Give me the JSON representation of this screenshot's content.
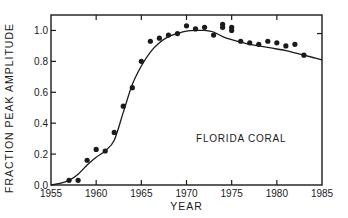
{
  "chart_data": {
    "type": "scatter",
    "title": "",
    "xlabel": "YEAR",
    "ylabel": "FRACTION PEAK AMPLITUDE",
    "xlim": [
      1955,
      1985
    ],
    "ylim": [
      0.0,
      1.1
    ],
    "x_ticks": [
      1955,
      1960,
      1965,
      1970,
      1975,
      1980,
      1985
    ],
    "x_tick_labels": [
      "1955",
      "1960",
      "1965",
      "1970",
      "1975",
      "1980",
      "1985"
    ],
    "y_ticks": [
      0.0,
      0.2,
      0.4,
      0.6,
      0.8,
      1.0
    ],
    "y_tick_labels": [
      "0.0",
      "0.2",
      "0.4",
      "0.6",
      "0.8",
      "1.0"
    ],
    "grid": false,
    "legend": null,
    "annotations": [
      {
        "text": "FLORIDA CORAL",
        "x": 1972,
        "y": 0.2
      }
    ],
    "series": [
      {
        "name": "Measured coral data",
        "style": "points",
        "points": [
          {
            "x": 1957,
            "y": 0.03
          },
          {
            "x": 1958,
            "y": 0.03
          },
          {
            "x": 1959,
            "y": 0.16
          },
          {
            "x": 1960,
            "y": 0.23
          },
          {
            "x": 1961,
            "y": 0.22
          },
          {
            "x": 1962,
            "y": 0.34
          },
          {
            "x": 1963,
            "y": 0.51
          },
          {
            "x": 1964,
            "y": 0.63
          },
          {
            "x": 1965,
            "y": 0.8
          },
          {
            "x": 1966,
            "y": 0.93
          },
          {
            "x": 1967,
            "y": 0.95
          },
          {
            "x": 1968,
            "y": 0.97
          },
          {
            "x": 1969,
            "y": 0.98
          },
          {
            "x": 1970,
            "y": 1.03
          },
          {
            "x": 1971,
            "y": 1.01
          },
          {
            "x": 1972,
            "y": 1.02
          },
          {
            "x": 1973,
            "y": 0.97
          },
          {
            "x": 1974,
            "y": 1.04
          },
          {
            "x": 1974,
            "y": 1.02
          },
          {
            "x": 1975,
            "y": 1.02
          },
          {
            "x": 1975,
            "y": 1.0
          },
          {
            "x": 1976,
            "y": 0.93
          },
          {
            "x": 1977,
            "y": 0.92
          },
          {
            "x": 1978,
            "y": 0.91
          },
          {
            "x": 1979,
            "y": 0.93
          },
          {
            "x": 1980,
            "y": 0.92
          },
          {
            "x": 1981,
            "y": 0.9
          },
          {
            "x": 1982,
            "y": 0.91
          },
          {
            "x": 1983,
            "y": 0.84
          }
        ]
      },
      {
        "name": "Model curve",
        "style": "line",
        "points": [
          {
            "x": 1955,
            "y": 0.0
          },
          {
            "x": 1956,
            "y": 0.01
          },
          {
            "x": 1957,
            "y": 0.03
          },
          {
            "x": 1958,
            "y": 0.07
          },
          {
            "x": 1959,
            "y": 0.13
          },
          {
            "x": 1960,
            "y": 0.18
          },
          {
            "x": 1961,
            "y": 0.22
          },
          {
            "x": 1962,
            "y": 0.29
          },
          {
            "x": 1963,
            "y": 0.47
          },
          {
            "x": 1964,
            "y": 0.65
          },
          {
            "x": 1965,
            "y": 0.77
          },
          {
            "x": 1966,
            "y": 0.86
          },
          {
            "x": 1967,
            "y": 0.92
          },
          {
            "x": 1968,
            "y": 0.96
          },
          {
            "x": 1969,
            "y": 0.98
          },
          {
            "x": 1970,
            "y": 0.995
          },
          {
            "x": 1971,
            "y": 1.0
          },
          {
            "x": 1972,
            "y": 1.0
          },
          {
            "x": 1973,
            "y": 0.99
          },
          {
            "x": 1974,
            "y": 0.96
          },
          {
            "x": 1975,
            "y": 0.94
          },
          {
            "x": 1976,
            "y": 0.925
          },
          {
            "x": 1977,
            "y": 0.91
          },
          {
            "x": 1978,
            "y": 0.9
          },
          {
            "x": 1979,
            "y": 0.89
          },
          {
            "x": 1980,
            "y": 0.88
          },
          {
            "x": 1981,
            "y": 0.87
          },
          {
            "x": 1982,
            "y": 0.855
          },
          {
            "x": 1983,
            "y": 0.84
          },
          {
            "x": 1984,
            "y": 0.825
          },
          {
            "x": 1985,
            "y": 0.81
          }
        ]
      }
    ]
  },
  "layout": {
    "plot_left": 51,
    "plot_right": 322,
    "plot_top": 15,
    "plot_bottom": 185,
    "color_ink": "#1a1a1a",
    "color_background": "#ffffff"
  }
}
